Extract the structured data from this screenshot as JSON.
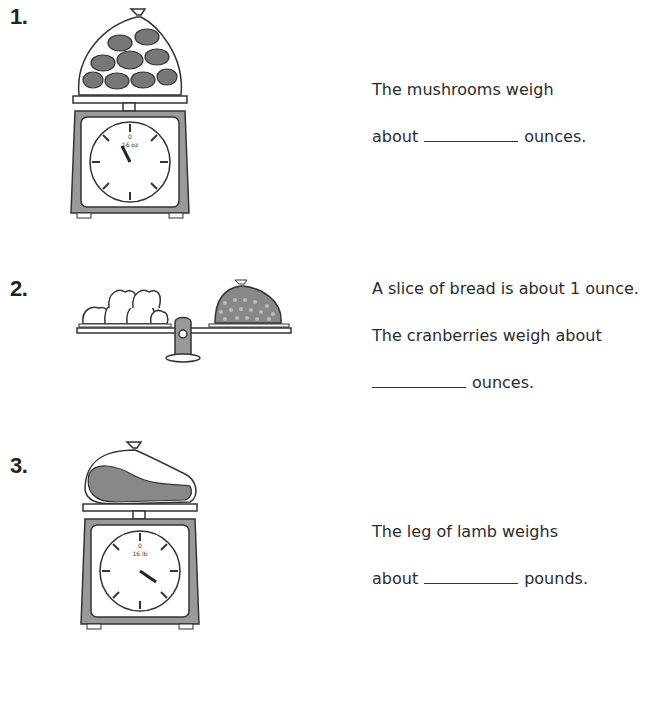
{
  "problems": [
    {
      "number": "1.",
      "scale": {
        "type": "dial",
        "unit_label": "16 oz",
        "ticks": [
          "0",
          "2",
          "4",
          "6",
          "8",
          "10",
          "12",
          "14"
        ],
        "pointer_value": 15
      },
      "item": "bag of mushrooms",
      "text_line1": "The mushrooms weigh",
      "text_prefix": "about",
      "text_suffix": "ounces."
    },
    {
      "number": "2.",
      "scale": {
        "type": "balance",
        "left": "6 slices of bread",
        "right": "bag of cranberries"
      },
      "text_line1": "A slice of bread is about 1 ounce.",
      "text_line2": "The cranberries weigh about",
      "text_suffix": "ounces."
    },
    {
      "number": "3.",
      "scale": {
        "type": "dial",
        "unit_label": "16 lb",
        "ticks": [
          "0",
          "2",
          "4",
          "6",
          "8",
          "10",
          "12",
          "14"
        ],
        "pointer_value": 5
      },
      "item": "leg of lamb",
      "text_line1": "The leg of lamb weighs",
      "text_prefix": "about",
      "text_suffix": "pounds."
    }
  ]
}
